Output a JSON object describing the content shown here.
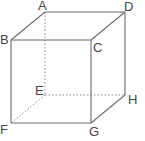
{
  "diagram": {
    "type": "cube",
    "colors": {
      "edge": "#6b6b6b",
      "hidden_edge": "#8a8a8a",
      "label": "#444444",
      "background": "#ffffff"
    },
    "vertices": {
      "A": {
        "label": "A",
        "x": 45,
        "y": 12
      },
      "B": {
        "label": "B",
        "x": 11,
        "y": 40
      },
      "C": {
        "label": "C",
        "x": 91,
        "y": 40
      },
      "D": {
        "label": "D",
        "x": 125,
        "y": 12
      },
      "E": {
        "label": "E",
        "x": 45,
        "y": 95
      },
      "F": {
        "label": "F",
        "x": 11,
        "y": 123
      },
      "G": {
        "label": "G",
        "x": 91,
        "y": 123
      },
      "H": {
        "label": "H",
        "x": 125,
        "y": 95
      }
    },
    "solid_edges": [
      "AB",
      "AD",
      "BC",
      "CD",
      "BF",
      "CG",
      "DH",
      "FG",
      "GH"
    ],
    "hidden_edges": [
      "AE",
      "EF",
      "EH"
    ]
  }
}
